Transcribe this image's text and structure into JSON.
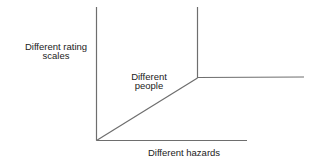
{
  "diagram": {
    "type": "3d-axes-schematic",
    "line_color": "#6e6e6e",
    "text_color": "#222222",
    "labels": {
      "vertical_axis": {
        "line1": "Different rating",
        "line2": "scales"
      },
      "depth_axis": {
        "line1": "Different",
        "line2": "people"
      },
      "horizontal_axis": {
        "line1": "Different hazards"
      }
    }
  }
}
